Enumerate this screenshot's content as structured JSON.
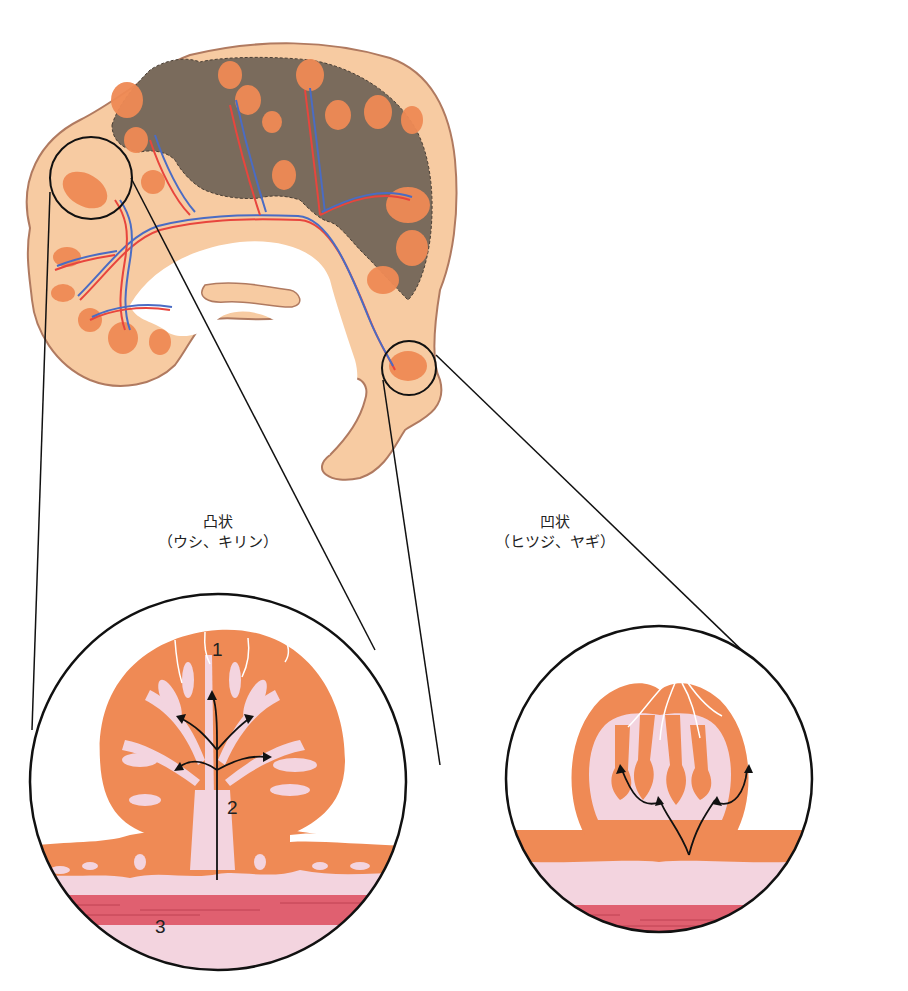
{
  "diagram": {
    "type": "anatomical illustration",
    "colors": {
      "fetus": "#7a6b5c",
      "chorion": "#f7cba2",
      "cotyledon": "#ef8a55",
      "artery": "#e8453d",
      "vein": "#4a6cc4",
      "endometrium": "#f3d4df",
      "myometrium": "#e06070",
      "outline": "#111111"
    }
  },
  "labels": {
    "left": {
      "title": "凸状",
      "subtitle": "（ウシ、キリン）"
    },
    "right": {
      "title": "凹状",
      "subtitle": "（ヒツジ、ヤギ）"
    },
    "markers": {
      "m1": "1",
      "m2": "2",
      "m3": "3"
    }
  }
}
